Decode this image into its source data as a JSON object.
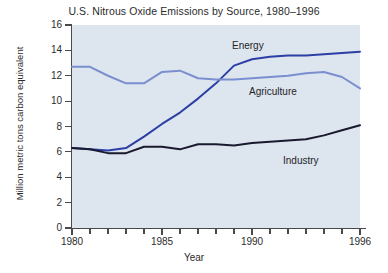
{
  "chart_data": {
    "type": "line",
    "title": "U.S. Nitrous Oxide Emissions by Source, 1980–1996",
    "xlabel": "Year",
    "ylabel": "Million metric tons carbon equivalent",
    "x": [
      1980,
      1981,
      1982,
      1983,
      1984,
      1985,
      1986,
      1987,
      1988,
      1989,
      1990,
      1991,
      1992,
      1993,
      1994,
      1995,
      1996
    ],
    "xlim": [
      1980,
      1996
    ],
    "ylim": [
      0,
      16
    ],
    "xticks": [
      1980,
      1981,
      1982,
      1983,
      1984,
      1985,
      1986,
      1987,
      1988,
      1989,
      1990,
      1991,
      1992,
      1993,
      1994,
      1995,
      1996
    ],
    "xtick_labels": [
      "1980",
      "1985",
      "1990",
      "1996"
    ],
    "xtick_label_values": [
      1980,
      1985,
      1990,
      1996
    ],
    "yticks": [
      0,
      2,
      4,
      6,
      8,
      10,
      12,
      14,
      16
    ],
    "ytick_labels": [
      "0",
      "2",
      "4",
      "6",
      "8",
      "10",
      "12",
      "14",
      "16"
    ],
    "grid": false,
    "legend": "inline-labels",
    "series": [
      {
        "name": "Energy",
        "color": "#2b3fa5",
        "label_position": "above-line",
        "values": [
          6.3,
          6.2,
          6.1,
          6.3,
          7.2,
          8.2,
          9.1,
          10.2,
          11.4,
          12.8,
          13.3,
          13.5,
          13.6,
          13.6,
          13.7,
          13.8,
          13.9
        ]
      },
      {
        "name": "Agriculture",
        "color": "#7b8fd0",
        "label_position": "below-line",
        "values": [
          12.7,
          12.7,
          12.0,
          11.4,
          11.4,
          12.3,
          12.4,
          11.8,
          11.7,
          11.7,
          11.8,
          11.9,
          12.0,
          12.2,
          12.3,
          11.9,
          11.0
        ]
      },
      {
        "name": "Industry",
        "color": "#1a1a2e",
        "label_position": "below-line",
        "values": [
          6.3,
          6.2,
          5.9,
          5.9,
          6.4,
          6.4,
          6.2,
          6.6,
          6.6,
          6.5,
          6.7,
          6.8,
          6.9,
          7.0,
          7.3,
          7.7,
          8.1
        ]
      }
    ]
  },
  "style": {
    "plot_background": "#dde5ef",
    "page_background": "#ffffff",
    "axis_color": "#4a4a4a",
    "text_color": "#2b2b2b"
  }
}
